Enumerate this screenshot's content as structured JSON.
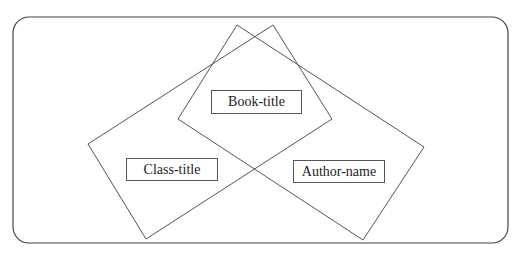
{
  "diagram": {
    "type": "venn-rectangles",
    "stroke_color": "#555555",
    "background": "#ffffff",
    "labels": {
      "book_title": "Book-title",
      "class_title": "Class-title",
      "author_name": "Author-name"
    }
  }
}
